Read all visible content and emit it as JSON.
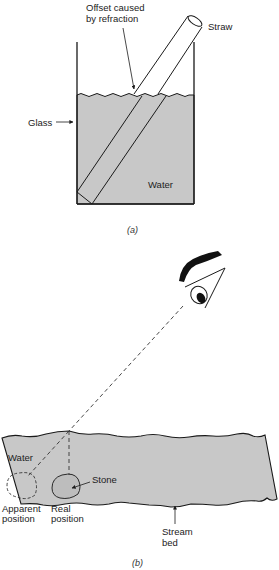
{
  "figure_a": {
    "labels": {
      "offset_line1": "Offset caused",
      "offset_line2": "by refraction",
      "straw": "Straw",
      "glass": "Glass",
      "water": "Water"
    },
    "caption": "(a)"
  },
  "figure_b": {
    "labels": {
      "water": "Water",
      "stone": "Stone",
      "apparent_line1": "Apparent",
      "apparent_line2": "position",
      "real_line1": "Real",
      "real_line2": "position",
      "stream_line1": "Stream",
      "stream_line2": "bed"
    },
    "caption": "(b)"
  },
  "colors": {
    "water": "#c8c8c8",
    "line": "#1a1a1a"
  }
}
